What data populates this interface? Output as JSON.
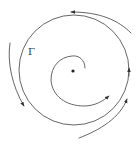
{
  "diagram": {
    "type": "phase-portrait",
    "limit_cycle": {
      "label": "Γ",
      "center": [
        74,
        70
      ],
      "radius": 55,
      "direction": "counterclockwise"
    },
    "equilibrium": {
      "kind": "unstable-focus",
      "position": [
        73,
        71
      ]
    },
    "inner_spiral": {
      "direction": "counterclockwise",
      "behavior": "spirals outward toward Γ"
    },
    "outer_trajectories": [
      {
        "name": "top",
        "behavior": "approaches Γ from outside"
      },
      {
        "name": "left",
        "behavior": "approaches Γ from outside"
      },
      {
        "name": "bottom-right",
        "behavior": "approaches Γ from outside"
      }
    ],
    "colors": {
      "line": "#555555",
      "dot": "#222222",
      "background": "#ffffff"
    }
  }
}
